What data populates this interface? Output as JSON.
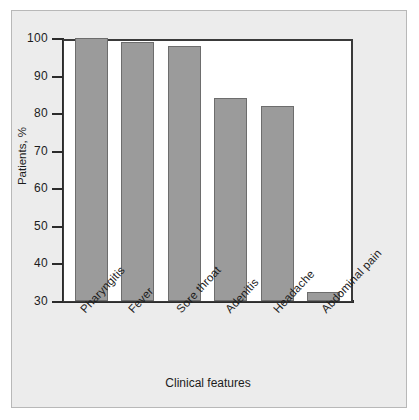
{
  "chart_data": {
    "type": "bar",
    "title": "",
    "xlabel": "Clinical features",
    "ylabel": "Patients, %",
    "categories": [
      "Pharyngitis",
      "Fever",
      "Sore throat",
      "Adenitis",
      "Headache",
      "Abdominal pain"
    ],
    "values": [
      100,
      99,
      98,
      84,
      82,
      32.5
    ],
    "ylim": [
      30,
      100
    ],
    "yticks": [
      30,
      40,
      50,
      60,
      70,
      80,
      90,
      100
    ],
    "ytick_labels": [
      "30",
      "40",
      "50",
      "60",
      "70",
      "80",
      "90",
      "100"
    ],
    "grid": false,
    "legend": null,
    "bar_color": "#9b9b9b",
    "bar_edge_color": "#6d6d6d",
    "plot_background": "#ffffff",
    "figure_background": "#ececec",
    "axis_color": "#2b2b2b"
  }
}
